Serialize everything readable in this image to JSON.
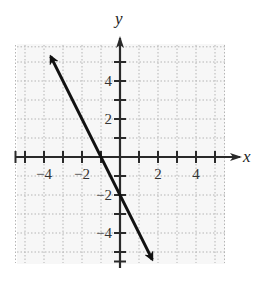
{
  "chart_data": {
    "type": "line",
    "title": "",
    "xlabel": "x",
    "ylabel": "y",
    "xlim": [
      -5.5,
      5.5
    ],
    "ylim": [
      -5.5,
      5.8
    ],
    "grid": true,
    "x_ticks": [
      -5,
      -4,
      -3,
      -2,
      -1,
      1,
      2,
      3,
      4,
      5
    ],
    "y_ticks": [
      -5,
      -4,
      -3,
      -2,
      -1,
      1,
      2,
      3,
      4,
      5
    ],
    "x_tick_labels": [
      {
        "value": -4,
        "label": "−4"
      },
      {
        "value": -2,
        "label": "−2"
      },
      {
        "value": 2,
        "label": "2"
      },
      {
        "value": 4,
        "label": "4"
      }
    ],
    "y_tick_labels": [
      {
        "value": 4,
        "label": "4"
      },
      {
        "value": 2,
        "label": "2"
      },
      {
        "value": -2,
        "label": "−2"
      },
      {
        "value": -4,
        "label": "−4"
      }
    ],
    "series": [
      {
        "name": "line",
        "equation": "y = -2x - 2",
        "x": [
          -3.65,
          1.7
        ],
        "y": [
          5.3,
          -5.4
        ],
        "arrows": "both"
      }
    ],
    "key_points": [
      {
        "x": -1,
        "y": 0,
        "note": "x-intercept"
      },
      {
        "x": 0,
        "y": -2,
        "note": "y-intercept"
      }
    ]
  },
  "labels": {
    "x_axis": "x",
    "y_axis": "y"
  },
  "colors": {
    "grid": "#b5b5b5",
    "axis": "#2a2a2a",
    "line": "#111111",
    "background": "#f7f7f7"
  }
}
